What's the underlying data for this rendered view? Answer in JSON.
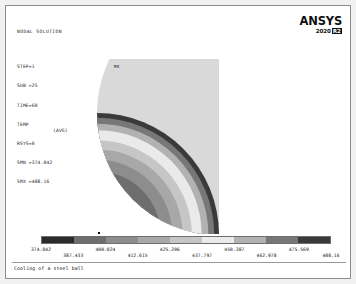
{
  "window": {
    "caption": "Cooling of a steel ball"
  },
  "logo": {
    "brand": "ANSYS",
    "version_year": "2020",
    "version_release": "R2"
  },
  "header": {
    "title": "NODAL SOLUTION",
    "rows": [
      {
        "key": "STEP=1",
        "value": ""
      },
      {
        "key": "SUB =25",
        "value": ""
      },
      {
        "key": "TIME=60",
        "value": ""
      },
      {
        "key": "TEMP",
        "value": "(AVG)"
      },
      {
        "key": "RSYS=0",
        "value": ""
      },
      {
        "key": "SMN =374.042",
        "value": ""
      },
      {
        "key": "SMX =488.16",
        "value": ""
      }
    ]
  },
  "plot": {
    "max_marker_label": "MX"
  },
  "chart_data": {
    "type": "heatmap",
    "title": "NODAL SOLUTION",
    "subtitle": "Cooling of a steel ball",
    "quantity": "TEMP",
    "averaging": "AVG",
    "step": 1,
    "substep": 25,
    "time": 60,
    "rsys": 0,
    "smn": 374.042,
    "smx": 488.16,
    "legend_position": "bottom",
    "grid": false,
    "geometry": "quarter-symmetry sphere cross-section",
    "contour_bands": 9,
    "tick_labels": [
      "374.042",
      "387.433",
      "400.024",
      "412.615",
      "425.206",
      "437.797",
      "450.387",
      "462.978",
      "475.569",
      "488.16"
    ],
    "tick_values": [
      374.042,
      387.433,
      400.024,
      412.615,
      425.206,
      437.797,
      450.387,
      462.978,
      475.569,
      488.16
    ],
    "band_ranges": [
      [
        374.042,
        387.433
      ],
      [
        387.433,
        400.024
      ],
      [
        400.024,
        412.615
      ],
      [
        412.615,
        425.206
      ],
      [
        425.206,
        437.797
      ],
      [
        437.797,
        450.387
      ],
      [
        450.387,
        462.978
      ],
      [
        462.978,
        475.569
      ],
      [
        475.569,
        488.16
      ]
    ],
    "band_colors": [
      "#2b2b2b",
      "#6e6e6e",
      "#8d8d8d",
      "#a8a8a8",
      "#c6c6c6",
      "#eaeaea",
      "#b2b2b2",
      "#777777",
      "#3a3a3a"
    ],
    "radial_profile_note": "Temperature increases from the sphere core outward; innermost region is darkest (lowest band), mid-radius is lightest, outer shell darkens again.",
    "band_radii_fraction": [
      0.0,
      0.4,
      0.52,
      0.62,
      0.7,
      0.78,
      0.855,
      0.915,
      0.965,
      1.0
    ]
  }
}
